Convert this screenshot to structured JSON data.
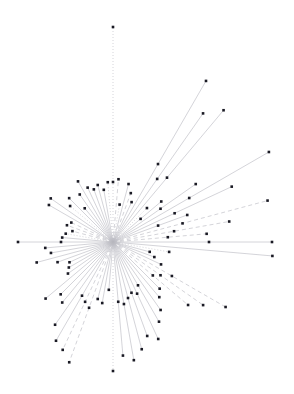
{
  "figure": {
    "title": "",
    "width": 294,
    "height": 394,
    "background_color": "#ffffff"
  },
  "chart_data": {
    "type": "scatter",
    "subtype": "polar-stem-radial-sunburst",
    "title": "",
    "subtitle": "",
    "xlabel": "",
    "ylabel": "",
    "grid": false,
    "axes_visible": false,
    "tick_labels_visible": false,
    "legend": null,
    "legend_position": "none",
    "annotations": [],
    "center": {
      "x": 113,
      "y": 242
    },
    "xlim": [
      0,
      294
    ],
    "ylim": [
      0,
      394
    ],
    "angle_units": "degrees",
    "angle_convention": "0 deg = east (+x), increasing counter-clockwise",
    "radius_units": "pixels",
    "marker": {
      "shape": "square",
      "size_px": 2.6,
      "color": "#1a1a24",
      "edge_color": "#1a1a24"
    },
    "line": {
      "color": "#c9c9cf",
      "width_px": 0.8,
      "styles_used": [
        "solid",
        "dashed",
        "dotted"
      ]
    },
    "series": [
      {
        "name": "radial stems",
        "point_count": 72,
        "columns": [
          "angle_deg",
          "radius_px",
          "line_style"
        ],
        "points": [
          [
            0,
            159,
            "solid"
          ],
          [
            5,
            94,
            "dashed"
          ],
          [
            10,
            118,
            "dashed"
          ],
          [
            15,
            160,
            "dashed"
          ],
          [
            20,
            79,
            "solid"
          ],
          [
            25,
            131,
            "solid"
          ],
          [
            30,
            180,
            "solid"
          ],
          [
            35,
            101,
            "solid"
          ],
          [
            40,
            63,
            "solid"
          ],
          [
            45,
            48,
            "dotted"
          ],
          [
            50,
            172,
            "solid"
          ],
          [
            55,
            157,
            "solid"
          ],
          [
            60,
            186,
            "solid"
          ],
          [
            65,
            44,
            "solid"
          ],
          [
            70,
            52,
            "dashed"
          ],
          [
            75,
            60,
            "solid"
          ],
          [
            80,
            38,
            "dotted"
          ],
          [
            85,
            63,
            "dashed"
          ],
          [
            90,
            215,
            "dotted"
          ],
          [
            95,
            60,
            "dotted"
          ],
          [
            100,
            53,
            "solid"
          ],
          [
            105,
            59,
            "solid"
          ],
          [
            110,
            56,
            "solid"
          ],
          [
            115,
            60,
            "solid"
          ],
          [
            120,
            70,
            "solid"
          ],
          [
            125,
            58,
            "solid"
          ],
          [
            130,
            44,
            "solid"
          ],
          [
            135,
            62,
            "solid"
          ],
          [
            140,
            56,
            "dotted"
          ],
          [
            145,
            76,
            "solid"
          ],
          [
            150,
            74,
            "solid"
          ],
          [
            155,
            46,
            "dashed"
          ],
          [
            160,
            49,
            "dashed"
          ],
          [
            165,
            42,
            "dashed"
          ],
          [
            170,
            48,
            "dotted"
          ],
          [
            175,
            51,
            "solid"
          ],
          [
            180,
            95,
            "solid"
          ],
          [
            185,
            68,
            "solid"
          ],
          [
            190,
            63,
            "solid"
          ],
          [
            195,
            79,
            "solid"
          ],
          [
            200,
            59,
            "solid"
          ],
          [
            205,
            48,
            "solid"
          ],
          [
            210,
            51,
            "solid"
          ],
          [
            215,
            55,
            "solid"
          ],
          [
            220,
            88,
            "solid"
          ],
          [
            225,
            74,
            "solid"
          ],
          [
            230,
            79,
            "solid"
          ],
          [
            235,
            101,
            "solid"
          ],
          [
            240,
            114,
            "solid"
          ],
          [
            245,
            119,
            "dashed"
          ],
          [
            250,
            128,
            "dashed"
          ],
          [
            255,
            59,
            "solid"
          ],
          [
            260,
            62,
            "solid"
          ],
          [
            265,
            48,
            "solid"
          ],
          [
            270,
            129,
            "dotted"
          ],
          [
            275,
            114,
            "solid"
          ],
          [
            280,
            120,
            "solid"
          ],
          [
            285,
            111,
            "solid"
          ],
          [
            290,
            100,
            "solid"
          ],
          [
            295,
            107,
            "solid"
          ],
          [
            300,
            92,
            "solid"
          ],
          [
            305,
            83,
            "solid"
          ],
          [
            310,
            72,
            "solid"
          ],
          [
            315,
            66,
            "solid"
          ],
          [
            320,
            98,
            "dashed"
          ],
          [
            325,
            110,
            "dashed"
          ],
          [
            330,
            130,
            "dashed"
          ],
          [
            335,
            53,
            "solid"
          ],
          [
            340,
            44,
            "solid"
          ],
          [
            345,
            38,
            "solid"
          ],
          [
            350,
            57,
            "dotted"
          ],
          [
            355,
            160,
            "solid"
          ]
        ]
      },
      {
        "name": "inner ring markers",
        "point_count": 26,
        "columns": [
          "angle_deg",
          "radius_px"
        ],
        "points": [
          [
            0,
            96
          ],
          [
            5,
            55
          ],
          [
            10,
            62
          ],
          [
            15,
            72
          ],
          [
            20,
            48
          ],
          [
            25,
            68
          ],
          [
            30,
            88
          ],
          [
            35,
            58
          ],
          [
            40,
            36
          ],
          [
            50,
            84
          ],
          [
            55,
            77
          ],
          [
            60,
            90
          ],
          [
            90,
            60
          ],
          [
            180,
            52
          ],
          [
            240,
            62
          ],
          [
            245,
            66
          ],
          [
            250,
            70
          ],
          [
            275,
            60
          ],
          [
            280,
            63
          ],
          [
            285,
            58
          ],
          [
            290,
            54
          ],
          [
            295,
            57
          ],
          [
            300,
            50
          ],
          [
            320,
            52
          ],
          [
            325,
            58
          ],
          [
            330,
            68
          ]
        ]
      }
    ]
  }
}
